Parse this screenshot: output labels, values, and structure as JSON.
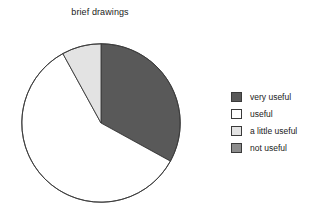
{
  "chart_data": {
    "type": "pie",
    "title": "brief drawings",
    "categories": [
      "very useful",
      "useful",
      "a little useful",
      "not useful"
    ],
    "values": [
      33,
      59,
      8,
      0
    ],
    "units": "percent",
    "colors": [
      "#595959",
      "#ffffff",
      "#e3e3e3",
      "#8c8c8c"
    ],
    "start_angle_deg": 0,
    "direction": "clockwise",
    "slice_angles_deg": [
      119,
      212,
      29,
      0
    ],
    "outline_color": "#3a3a3a",
    "legend_position": "right",
    "grid": false,
    "xlabel": "",
    "ylabel": ""
  },
  "title": {
    "text": "brief drawings"
  },
  "legend": {
    "items": [
      {
        "label": "very useful",
        "color": "#595959"
      },
      {
        "label": "useful",
        "color": "#ffffff"
      },
      {
        "label": "a little useful",
        "color": "#e3e3e3"
      },
      {
        "label": "not useful",
        "color": "#8c8c8c"
      }
    ]
  }
}
